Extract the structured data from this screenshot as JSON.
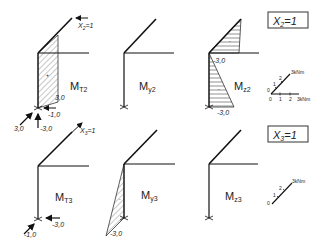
{
  "rows": [
    {
      "load_case": "X2=1",
      "load_case_main": "X",
      "load_case_sub": "2",
      "load_case_val": "=1",
      "panels": [
        {
          "id": "MT2",
          "label_main": "M",
          "label_sub": "T2",
          "hatch": "diagonal",
          "values": [
            "3,0"
          ],
          "sign_marks": [
            "+"
          ],
          "reactions": [
            "-1,0",
            "3,0",
            "-3,0"
          ],
          "applied_load": "X2=1"
        },
        {
          "id": "My2",
          "label_main": "M",
          "label_sub": "y2",
          "values": []
        },
        {
          "id": "Mz2",
          "label_main": "M",
          "label_sub": "z2",
          "hatch": "horizontal",
          "values": [
            "-3,0",
            "-3,0"
          ],
          "sign_marks": [
            "-",
            "-"
          ]
        }
      ],
      "scale": {
        "unit": "kNm",
        "axis1_label": "3kNm",
        "axis1_ticks": [
          "0",
          "1",
          "2"
        ],
        "axis2_label": "3kNm",
        "axis2_ticks": [
          "0",
          "1",
          "2"
        ]
      }
    },
    {
      "load_case": "X3=1",
      "load_case_main": "X",
      "load_case_sub": "3",
      "load_case_val": "=1",
      "panels": [
        {
          "id": "MT3",
          "label_main": "M",
          "label_sub": "T3",
          "values": [],
          "reactions": [
            "-3,0",
            "-1,0"
          ],
          "applied_load": "X3=1"
        },
        {
          "id": "My3",
          "label_main": "M",
          "label_sub": "y3",
          "hatch": "diagonal",
          "values": [
            "-3,0"
          ],
          "sign_marks": [
            "-"
          ]
        },
        {
          "id": "Mz3",
          "label_main": "M",
          "label_sub": "z3",
          "values": []
        }
      ],
      "scale": {
        "unit": "kNm",
        "axis1_label": "3kNm",
        "axis1_ticks": [
          "0",
          "1",
          "2"
        ]
      }
    }
  ]
}
